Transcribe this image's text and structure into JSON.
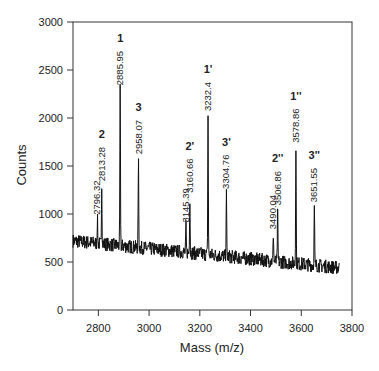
{
  "chart_data": {
    "type": "line",
    "title": "",
    "xlabel": "Mass (m/z)",
    "ylabel": "Counts",
    "xlim": [
      2700,
      3800
    ],
    "ylim": [
      0,
      3000
    ],
    "xticks": [
      2800,
      3000,
      3200,
      3400,
      3600,
      3800
    ],
    "yticks": [
      0,
      500,
      1000,
      1500,
      2000,
      2500,
      3000
    ],
    "grid": false,
    "legend": null,
    "trace_range": [
      2700,
      3750
    ],
    "baseline": {
      "start": 720,
      "end": 440,
      "noise": 90
    },
    "peaks": [
      {
        "mass": 2796.32,
        "counts": 950,
        "mass_label": "2796.32",
        "id_label": ""
      },
      {
        "mass": 2813.28,
        "counts": 1300,
        "mass_label": "2813.28",
        "id_label": "2"
      },
      {
        "mass": 2885.95,
        "counts": 2300,
        "mass_label": "2885.95",
        "id_label": "1"
      },
      {
        "mass": 2958.07,
        "counts": 1580,
        "mass_label": "2958.07",
        "id_label": "3"
      },
      {
        "mass": 3145.39,
        "counts": 870,
        "mass_label": "3145.39",
        "id_label": ""
      },
      {
        "mass": 3160.66,
        "counts": 1180,
        "mass_label": "3160.66",
        "id_label": "2'"
      },
      {
        "mass": 3232.4,
        "counts": 2030,
        "mass_label": "3232.4",
        "id_label": "1'"
      },
      {
        "mass": 3304.76,
        "counts": 1220,
        "mass_label": "3304.76",
        "id_label": "3'"
      },
      {
        "mass": 3490.04,
        "counts": 800,
        "mass_label": "3490.04",
        "id_label": ""
      },
      {
        "mass": 3506.86,
        "counts": 1050,
        "mass_label": "3506.86",
        "id_label": "2''"
      },
      {
        "mass": 3578.86,
        "counts": 1700,
        "mass_label": "3578.86",
        "id_label": "1''"
      },
      {
        "mass": 3651.55,
        "counts": 1080,
        "mass_label": "3651.55",
        "id_label": "3''"
      }
    ]
  },
  "colors": {
    "trace": "#111111",
    "axis": "#333333",
    "background": "#ffffff"
  }
}
